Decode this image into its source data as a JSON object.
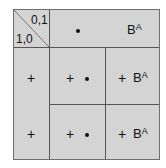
{
  "corner": {
    "top_right": "0,1",
    "bottom_left": "1,0"
  },
  "header": {
    "dot": "•",
    "b_base": "B",
    "b_sup": "A"
  },
  "rows": [
    {
      "left": "+",
      "middle_plus": "+",
      "right_plus": "+",
      "right_b": "B",
      "right_sup": "A"
    },
    {
      "left": "+",
      "middle_plus": "+",
      "right_plus": "+",
      "right_b": "B",
      "right_sup": "A"
    }
  ],
  "colors": {
    "cell_fill": "#d4d4d4",
    "grid_line": "#555555",
    "text": "#111111"
  }
}
